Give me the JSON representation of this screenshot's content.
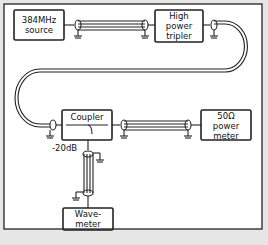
{
  "diagram": {
    "background": "#ffffff",
    "frame_color": "#222222",
    "footer_color": "#e4e4e4",
    "blocks": [
      {
        "id": "source",
        "label": "384MHz source",
        "line1": "384MHz",
        "line2": "source"
      },
      {
        "id": "tripler",
        "label": "High power tripler",
        "line1": "High",
        "line2": "power",
        "line3": "tripler"
      },
      {
        "id": "coupler",
        "label": "Coupler",
        "line1": "Coupler"
      },
      {
        "id": "powermeter",
        "label": "50Ω power meter",
        "line1": "50Ω",
        "line2": "power",
        "line3": "meter"
      },
      {
        "id": "wavemeter",
        "label": "Wavemeter",
        "line1": "Wave-",
        "line2": "meter"
      }
    ],
    "annotations": {
      "coupling": "-20dB"
    },
    "connections": [
      {
        "from": "source",
        "to": "tripler",
        "type": "coaxial cable"
      },
      {
        "from": "tripler",
        "to": "coupler",
        "type": "coaxial cable"
      },
      {
        "from": "coupler",
        "to": "powermeter",
        "type": "coaxial cable"
      },
      {
        "from": "coupler",
        "to": "wavemeter",
        "type": "coaxial cable",
        "label": "-20dB"
      }
    ]
  }
}
